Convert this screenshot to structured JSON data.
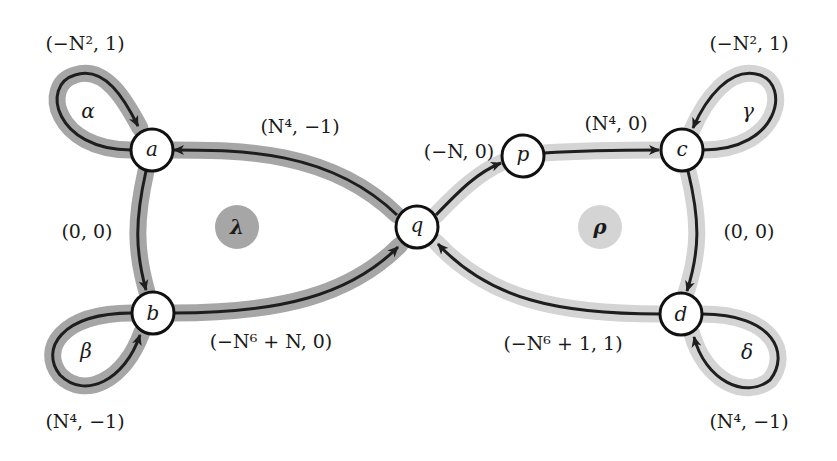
{
  "colors": {
    "lambda_cycle": "#a6a6a6",
    "rho_cycle": "#d4d4d4",
    "edge": "#1e1e1e",
    "node_fill": "#ffffff",
    "node_stroke": "#111111"
  },
  "nodes": [
    {
      "id": "a",
      "label": "a"
    },
    {
      "id": "b",
      "label": "b"
    },
    {
      "id": "q",
      "label": "q"
    },
    {
      "id": "p",
      "label": "p"
    },
    {
      "id": "c",
      "label": "c"
    },
    {
      "id": "d",
      "label": "d"
    }
  ],
  "regions": {
    "lambda": {
      "label": "λ",
      "shade": "dark"
    },
    "rho": {
      "label": "ρ",
      "shade": "light"
    }
  },
  "loops": {
    "alpha": {
      "name": "α",
      "node": "a",
      "weight": "(−N², 1)"
    },
    "beta": {
      "name": "β",
      "node": "b",
      "weight": "(N⁴, −1)"
    },
    "gamma": {
      "name": "γ",
      "node": "c",
      "weight": "(−N², 1)"
    },
    "delta": {
      "name": "δ",
      "node": "d",
      "weight": "(N⁴, −1)"
    }
  },
  "edges": {
    "q_to_a": {
      "from": "q",
      "to": "a",
      "weight": "(N⁴, −1)"
    },
    "a_to_b": {
      "from": "a",
      "to": "b",
      "weight": "(0, 0)"
    },
    "b_to_q": {
      "from": "b",
      "to": "q",
      "weight": "(−N⁶ + N, 0)"
    },
    "q_to_p": {
      "from": "q",
      "to": "p",
      "weight": "(−N, 0)"
    },
    "p_to_c": {
      "from": "p",
      "to": "c",
      "weight": "(N⁴, 0)"
    },
    "c_to_d": {
      "from": "c",
      "to": "d",
      "weight": "(0, 0)"
    },
    "d_to_q": {
      "from": "d",
      "to": "q",
      "weight": "(−N⁶ + 1, 1)"
    }
  }
}
